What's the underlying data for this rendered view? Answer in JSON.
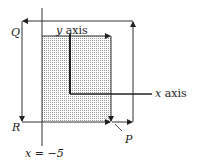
{
  "diagram": {
    "labels": {
      "q": "Q",
      "r": "R",
      "p": "P",
      "y_axis": "y axis",
      "x_axis": "x axis",
      "line_eq": "x = −5"
    },
    "colors": {
      "ink": "#222222",
      "dots": "#8a8a8a"
    }
  }
}
